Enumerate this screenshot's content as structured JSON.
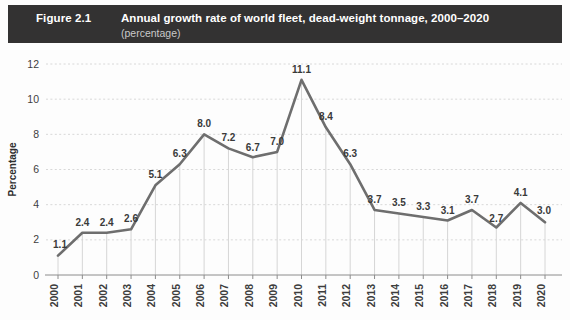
{
  "header": {
    "figure_number": "Figure 2.1",
    "title": "Annual growth rate of world fleet, dead-weight tonnage, 2000–2020",
    "subtitle": "(percentage)",
    "background_color": "#333232",
    "title_color": "#ffffff",
    "subtitle_color": "#c9c9c9"
  },
  "colors": {
    "line": "#6e6e6e",
    "grid_horizontal": "#d8d8d8",
    "grid_vertical": "#d6d6d6",
    "axis": "#8c8c8c",
    "text": "#3d3d3d",
    "background": "#fdfdfd"
  },
  "chart_data": {
    "type": "line",
    "title": "Annual growth rate of world fleet, dead-weight tonnage, 2000–2020",
    "subtitle": "(percentage)",
    "xlabel": "",
    "ylabel": "Percentage",
    "categories": [
      "2000",
      "2001",
      "2002",
      "2003",
      "2004",
      "2005",
      "2006",
      "2007",
      "2008",
      "2009",
      "2010",
      "2011",
      "2012",
      "2013",
      "2014",
      "2015",
      "2016",
      "2017",
      "2018",
      "2019",
      "2020"
    ],
    "values": [
      1.1,
      2.4,
      2.4,
      2.6,
      5.1,
      6.3,
      8.0,
      7.2,
      6.7,
      7.0,
      11.1,
      8.4,
      6.3,
      3.7,
      3.5,
      3.3,
      3.1,
      3.7,
      2.7,
      4.1,
      3.0
    ],
    "data_labels": [
      "1.1",
      "2.4",
      "2.4",
      "2.6",
      "5.1",
      "6.3",
      "8.0",
      "7.2",
      "6.7",
      "7.0",
      "11.1",
      "8.4",
      "6.3",
      "3.7",
      "3.5",
      "3.3",
      "3.1",
      "3.7",
      "2.7",
      "4.1",
      "3.0"
    ],
    "ylim": [
      0,
      12
    ],
    "yticks": [
      0,
      2,
      4,
      6,
      8,
      10,
      12
    ],
    "ytick_labels": [
      "0",
      "2",
      "4",
      "6",
      "8",
      "10",
      "12"
    ],
    "grid": {
      "horizontal": true,
      "horizontal_style": "dashed",
      "vertical": true,
      "vertical_style": "solid"
    },
    "legend": null,
    "legend_position": "none",
    "xtick_rotation": -90,
    "series_name": "Annual growth rate"
  }
}
